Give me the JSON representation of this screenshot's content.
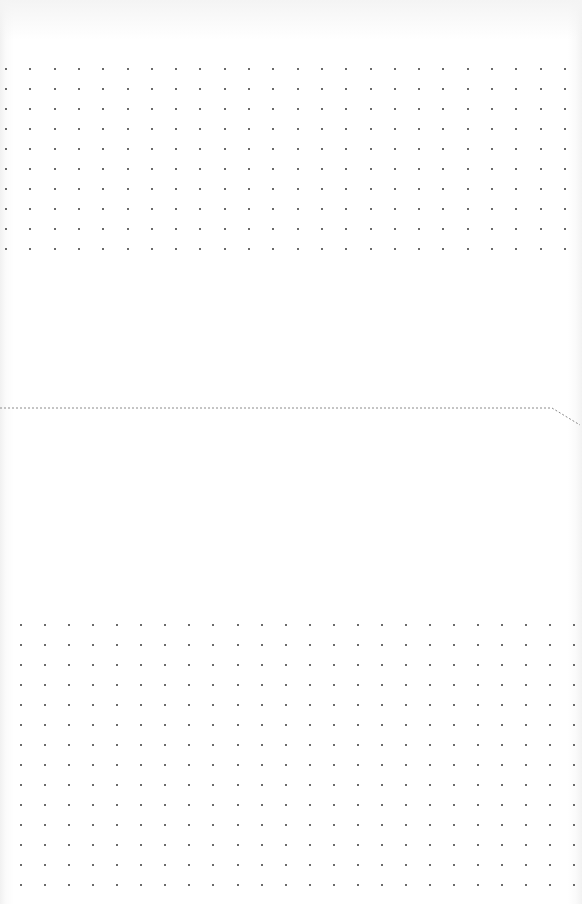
{
  "page": {
    "type": "dot-grid notebook sheet",
    "background_color": "#ffffff",
    "dot_color": "#3a3a3a",
    "line_color": "#8a8a8a"
  },
  "top_grid": {
    "origin_x": 6,
    "origin_y": 69,
    "columns": 24,
    "rows": 10,
    "spacing_x": 24.3,
    "spacing_y": 20
  },
  "bottom_grid": {
    "origin_x": 21,
    "origin_y": 625,
    "columns": 24,
    "rows": 14,
    "spacing_x": 24.06,
    "spacing_y": 20
  },
  "fold_line": {
    "style": "dashed",
    "points": [
      [
        0,
        408
      ],
      [
        552,
        408
      ],
      [
        580,
        425
      ]
    ]
  }
}
